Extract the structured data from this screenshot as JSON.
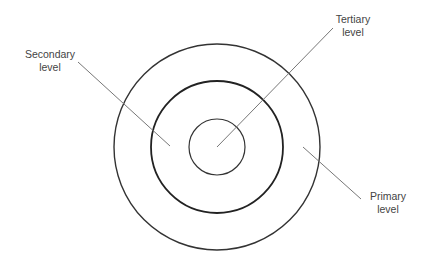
{
  "diagram": {
    "type": "concentric-circles",
    "center": [
      217,
      147
    ],
    "rings": [
      {
        "name": "tertiary",
        "radius": 28,
        "stroke": "#333333",
        "width": 1.2
      },
      {
        "name": "secondary",
        "radius": 66,
        "stroke": "#222222",
        "width": 1.8
      },
      {
        "name": "primary",
        "radius": 103,
        "stroke": "#333333",
        "width": 1.4
      }
    ],
    "labels": {
      "secondary": {
        "line1": "Secondary",
        "line2": "level"
      },
      "tertiary": {
        "line1": "Tertiary",
        "line2": "level"
      },
      "primary": {
        "line1": "Primary",
        "line2": "level"
      }
    },
    "leader_color": "#777777"
  }
}
